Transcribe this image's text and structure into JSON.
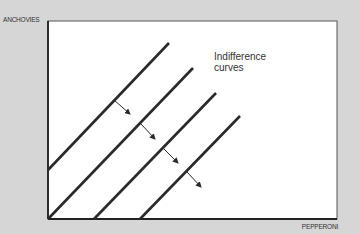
{
  "diagram": {
    "y_axis_label": "ANCHOVIES",
    "x_axis_label": "PEPPERONI",
    "annotation": {
      "line1": "Indifference",
      "line2": "curves"
    },
    "colors": {
      "background": "#d6d6d6",
      "plot_area": "#ffffff",
      "lines": "#2a2a2a"
    },
    "curves": [
      {
        "x1": 48,
        "y1": 170,
        "x2": 169,
        "y2": 43
      },
      {
        "x1": 48,
        "y1": 219,
        "x2": 193,
        "y2": 68
      },
      {
        "x1": 94,
        "y1": 219,
        "x2": 216,
        "y2": 93
      },
      {
        "x1": 140,
        "y1": 219,
        "x2": 240,
        "y2": 116
      }
    ],
    "arrows": [
      {
        "x1": 114,
        "y1": 100,
        "x2": 130,
        "y2": 114
      },
      {
        "x1": 141,
        "y1": 124,
        "x2": 155,
        "y2": 139
      },
      {
        "x1": 164,
        "y1": 149,
        "x2": 178,
        "y2": 163
      },
      {
        "x1": 187,
        "y1": 172,
        "x2": 201,
        "y2": 187
      }
    ]
  }
}
